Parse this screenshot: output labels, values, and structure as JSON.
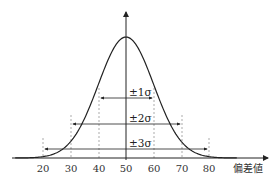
{
  "chart_data": {
    "type": "line",
    "title": "",
    "xlabel": "偏差値",
    "ylabel": "",
    "curve": "normal distribution",
    "mean": 50,
    "sd": 10,
    "x_ticks": [
      20,
      30,
      40,
      50,
      60,
      70,
      80
    ],
    "x_tick_labels": [
      "20",
      "30",
      "40",
      "50",
      "60",
      "70",
      "80"
    ],
    "xlim": [
      5,
      95
    ],
    "grid": false,
    "legend": null,
    "intervals": [
      {
        "label": "±1σ",
        "from": 40,
        "to": 60
      },
      {
        "label": "±2σ",
        "from": 30,
        "to": 70
      },
      {
        "label": "±3σ",
        "from": 20,
        "to": 80
      }
    ],
    "colors": {
      "curve": "#222222",
      "axis": "#222222",
      "guides": "#999999"
    }
  }
}
